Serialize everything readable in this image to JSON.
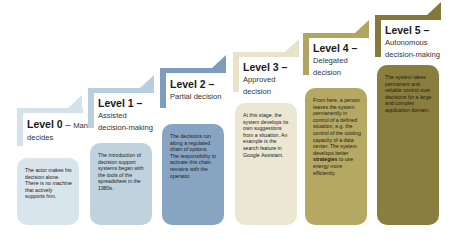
{
  "diagram": {
    "type": "staircase",
    "levels": [
      {
        "id": 0,
        "label": "Level 0",
        "dash": " – ",
        "inline_name": "Man",
        "name_line2": "decides",
        "color": "#d5e2ea",
        "card_color": "#d9e5ec",
        "text_color": "#222222",
        "description": "The actor makes his decision alone. There is no machine that actively supports him."
      },
      {
        "id": 1,
        "label": "Level 1",
        "dash": " –",
        "name_line1": "Assisted",
        "name_line2": "decision-making",
        "color": "#b9cfdb",
        "card_color": "#bfd3de",
        "text_color": "#222222",
        "description": "The introduction of decision support systems began with the tools of the spreadsheet in the 1980s."
      },
      {
        "id": 2,
        "label": "Level 2",
        "dash": " –",
        "name_line1": "Partial decision",
        "color": "#7e9cbb",
        "card_color": "#87a4c2",
        "text_color": "#222222",
        "description": "The decisions run along a regulated chain of options. The responsibility to activate this chain remains with the operator."
      },
      {
        "id": 3,
        "label": "Level 3",
        "dash": " –",
        "name_line1": "Approved",
        "name_line2": "decision",
        "color": "#e8e3c8",
        "card_color": "#ebe7d2",
        "text_color": "#222222",
        "description": "At this stage, the system develops its own suggestions from a situation. An example is the search feature in Google Assistant."
      },
      {
        "id": 4,
        "label": "Level 4",
        "dash": " –",
        "name_line1": "Delegated",
        "name_line2": "decision",
        "color": "#b2a55f",
        "card_color": "#b4a862",
        "text_color": "#222222",
        "description_before": "From here, a person leaves the system permanently in control of a defined situation, e.g. the control of the cooling capacity of a data center. The system develops better ",
        "description_bold": "strategies",
        "description_after": " to use energy more efficiently."
      },
      {
        "id": 5,
        "label": "Level 5",
        "dash": " –",
        "name_line1": "Autonomous",
        "name_line2": "decision-making",
        "color": "#85793a",
        "card_color": "#8a7e3e",
        "text_color": "#1e1e10",
        "description": "The system takes permanent and reliable control over decisions for a large and complex application domain."
      }
    ]
  }
}
